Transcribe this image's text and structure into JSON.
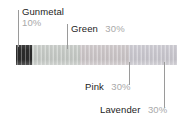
{
  "canvas": {
    "width": 183,
    "height": 121,
    "background": "#ffffff"
  },
  "chart_data": {
    "type": "bar",
    "title": "",
    "xlabel": "",
    "ylabel": "",
    "orientation": "horizontal-stacked",
    "total_percent": 100,
    "categories": [
      "Gunmetal",
      "Green",
      "Pink",
      "Lavender"
    ],
    "values": [
      10,
      30,
      30,
      30
    ],
    "value_labels": [
      "10%",
      "30%",
      "30%",
      "30%"
    ],
    "colors": [
      "#2b2b2b",
      "#c9cdc9",
      "#cfc9cb",
      "#cdcbd2"
    ],
    "legend": "callout-labels",
    "grid": false
  },
  "bar": {
    "segments": [
      {
        "name": "Gunmetal",
        "percent": 10,
        "color": "#2b2b2b"
      },
      {
        "name": "Green",
        "percent": 30,
        "color": "#c9cdc9"
      },
      {
        "name": "Pink",
        "percent": 30,
        "color": "#cfc9cb"
      },
      {
        "name": "Lavender",
        "percent": 30,
        "color": "#cdcbd2"
      }
    ]
  },
  "callouts": {
    "gunmetal": {
      "name": "Gunmetal",
      "percent": "10%"
    },
    "green": {
      "name": "Green",
      "percent": "30%"
    },
    "pink": {
      "name": "Pink",
      "percent": "30%"
    },
    "lavender": {
      "name": "Lavender",
      "percent": "30%"
    }
  },
  "style": {
    "name_color": "#1c1c1c",
    "percent_color": "#a9a9a9",
    "leader_color": "#9a9a9a"
  }
}
